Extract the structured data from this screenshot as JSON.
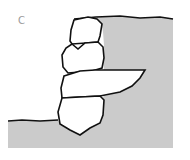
{
  "figure": {
    "label": "C",
    "colors": {
      "fill": "#cbcbcb",
      "outline": "#111111",
      "background": "#ffffff"
    },
    "stones": [
      {
        "name": "top-stone"
      },
      {
        "name": "second-stone"
      },
      {
        "name": "through-stone"
      },
      {
        "name": "base-stone"
      }
    ]
  }
}
